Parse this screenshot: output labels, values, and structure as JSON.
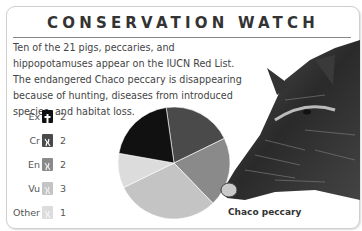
{
  "header": {
    "title": "CONSERVATION WATCH"
  },
  "description": "Ten of the 21 pigs, peccaries, and hippopotamuses appear on the IUCN Red List. The endangered Chaco peccary is disappearing because of hunting, diseases from introduced species, and habitat loss.",
  "legend": [
    {
      "label": "Ex",
      "value": "2",
      "color": "#111111",
      "icon": "cross-icon"
    },
    {
      "label": "Cr",
      "value": "2",
      "color": "#4a4a4a",
      "icon": "pig-icon"
    },
    {
      "label": "En",
      "value": "2",
      "color": "#8a8a8a",
      "icon": "pig-icon"
    },
    {
      "label": "Vu",
      "value": "3",
      "color": "#c4c4c4",
      "icon": "pig-icon"
    },
    {
      "label": "Other",
      "value": "1",
      "color": "#dcdcdc",
      "icon": "pig-icon"
    }
  ],
  "image_caption": "Chaco peccary",
  "chart_data": {
    "type": "pie",
    "title": "CONSERVATION WATCH",
    "categories": [
      "Ex",
      "Cr",
      "En",
      "Vu",
      "Other"
    ],
    "values": [
      2,
      2,
      2,
      3,
      1
    ],
    "colors": [
      "#111111",
      "#4a4a4a",
      "#8a8a8a",
      "#c4c4c4",
      "#dcdcdc"
    ],
    "total": 10,
    "legend_position": "left"
  }
}
